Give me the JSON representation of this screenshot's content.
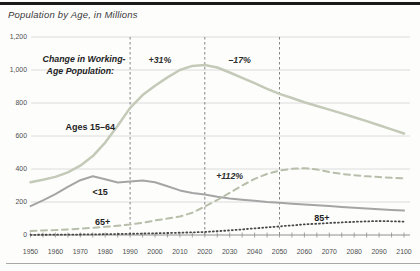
{
  "header": {
    "title": "Population by Age, in Millions"
  },
  "chart_data": {
    "type": "line",
    "title": "Population by Age, in Millions",
    "x_axis": {
      "min": 1950,
      "max": 2100,
      "minor_tick_step": 5,
      "label_years": [
        1950,
        1960,
        1970,
        1980,
        1990,
        2000,
        2010,
        2020,
        2030,
        2040,
        2050,
        2060,
        2070,
        2080,
        2090,
        2100
      ]
    },
    "y_axis": {
      "min": 0,
      "max": 1200,
      "ticks": [
        {
          "value": 0,
          "label": "0"
        },
        {
          "value": 200,
          "label": "200"
        },
        {
          "value": 400,
          "label": "400"
        },
        {
          "value": 600,
          "label": "600"
        },
        {
          "value": 800,
          "label": "800"
        },
        {
          "value": 1000,
          "label": "1,000"
        },
        {
          "value": 1200,
          "label": "1,200"
        }
      ]
    },
    "reference_lines_years": [
      1990,
      2020,
      2050
    ],
    "series": [
      {
        "id": "ages-15-64",
        "name": "Ages 15–64",
        "color": "#c3cab7",
        "width": 2.5,
        "dash": "",
        "x": [
          1950,
          1955,
          1960,
          1965,
          1970,
          1975,
          1980,
          1985,
          1990,
          1995,
          2000,
          2005,
          2010,
          2015,
          2020,
          2025,
          2030,
          2035,
          2040,
          2045,
          2050,
          2055,
          2060,
          2065,
          2070,
          2075,
          2080,
          2085,
          2090,
          2095,
          2100
        ],
        "values": [
          320,
          335,
          352,
          380,
          420,
          478,
          560,
          662,
          770,
          848,
          905,
          955,
          1000,
          1025,
          1030,
          1015,
          985,
          953,
          920,
          886,
          855,
          830,
          805,
          782,
          760,
          737,
          714,
          690,
          665,
          640,
          615
        ]
      },
      {
        "id": "under-15",
        "name": "<15",
        "color": "#a5a5a5",
        "width": 2,
        "dash": "",
        "x": [
          1950,
          1955,
          1960,
          1965,
          1970,
          1975,
          1980,
          1985,
          1990,
          1995,
          2000,
          2005,
          2010,
          2015,
          2020,
          2025,
          2030,
          2035,
          2040,
          2045,
          2050,
          2055,
          2060,
          2065,
          2070,
          2075,
          2080,
          2085,
          2090,
          2095,
          2100
        ],
        "values": [
          175,
          210,
          248,
          292,
          332,
          356,
          338,
          318,
          325,
          331,
          320,
          295,
          270,
          255,
          245,
          232,
          222,
          214,
          207,
          200,
          195,
          190,
          185,
          180,
          175,
          170,
          165,
          160,
          156,
          152,
          148
        ]
      },
      {
        "id": "65-plus",
        "name": "65+",
        "color": "#b7bfaa",
        "width": 2,
        "dash": "6 4.5",
        "x": [
          1950,
          1955,
          1960,
          1965,
          1970,
          1975,
          1980,
          1985,
          1990,
          1995,
          2000,
          2005,
          2010,
          2015,
          2020,
          2025,
          2030,
          2035,
          2040,
          2045,
          2050,
          2055,
          2060,
          2065,
          2070,
          2075,
          2080,
          2085,
          2090,
          2095,
          2100
        ],
        "values": [
          25,
          27,
          30,
          34,
          38,
          44,
          50,
          56,
          63,
          74,
          88,
          100,
          112,
          135,
          172,
          212,
          255,
          300,
          340,
          370,
          390,
          402,
          405,
          397,
          382,
          370,
          362,
          356,
          351,
          347,
          344
        ]
      },
      {
        "id": "85-plus",
        "name": "85+",
        "color": "#484848",
        "width": 1.8,
        "dash": "1 2.8",
        "x": [
          1950,
          1960,
          1970,
          1980,
          1990,
          2000,
          2010,
          2020,
          2030,
          2040,
          2050,
          2060,
          2070,
          2080,
          2090,
          2100
        ],
        "values": [
          1,
          2,
          3,
          5,
          7,
          10,
          14,
          18,
          28,
          40,
          52,
          64,
          73,
          80,
          85,
          81
        ]
      }
    ],
    "annotations": [
      {
        "id": "note-line-1",
        "text": "Change in Working-",
        "year": 1971.5,
        "value": 1065,
        "style": "note"
      },
      {
        "id": "note-line-2",
        "text": "Age Population:",
        "year": 1970,
        "value": 990,
        "style": "note"
      },
      {
        "id": "pct-1990-2020",
        "text": "+31%",
        "year": 2002,
        "value": 1055,
        "style": "pct"
      },
      {
        "id": "pct-2020-2050",
        "text": "–17%",
        "year": 2034,
        "value": 1055,
        "style": "pct"
      },
      {
        "id": "pct-65-plus",
        "text": "+112%",
        "year": 2030,
        "value": 352,
        "style": "pct"
      },
      {
        "id": "label-ages-15-64",
        "text": "Ages 15–64",
        "year": 1974,
        "value": 650,
        "style": "series-label"
      },
      {
        "id": "label-under-15",
        "text": "<15",
        "year": 1978,
        "value": 255,
        "style": "series-label"
      },
      {
        "id": "label-65-plus",
        "text": "65+",
        "year": 1979,
        "value": 75,
        "style": "series-label"
      },
      {
        "id": "label-85-plus",
        "text": "85+",
        "year": 2067,
        "value": 100,
        "style": "series-label"
      }
    ],
    "colors": {
      "gridline": "#dcdcdc",
      "axis_line": "#8f8f8f",
      "reference_line": "#777777",
      "top_bar": "#1a1a1a",
      "bottom_rule": "#a8a8a8"
    }
  }
}
